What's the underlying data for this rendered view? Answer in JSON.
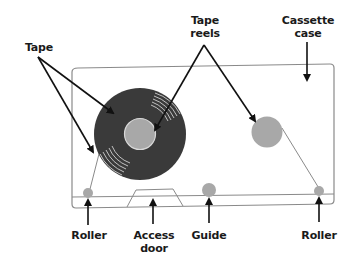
{
  "diagram": {
    "labels": {
      "tape": "Tape",
      "tape_reels_line1": "Tape",
      "tape_reels_line2": "reels",
      "cassette_case_line1": "Cassette",
      "cassette_case_line2": "case",
      "roller_left": "Roller",
      "access_door_line1": "Access",
      "access_door_line2": "door",
      "guide": "Guide",
      "roller_right": "Roller"
    },
    "colors": {
      "reel_tape": "#3a3a3a",
      "hub": "#a8a8a8",
      "case_outline": "#888888",
      "arrow": "#111111",
      "tape_line": "#888888"
    }
  }
}
